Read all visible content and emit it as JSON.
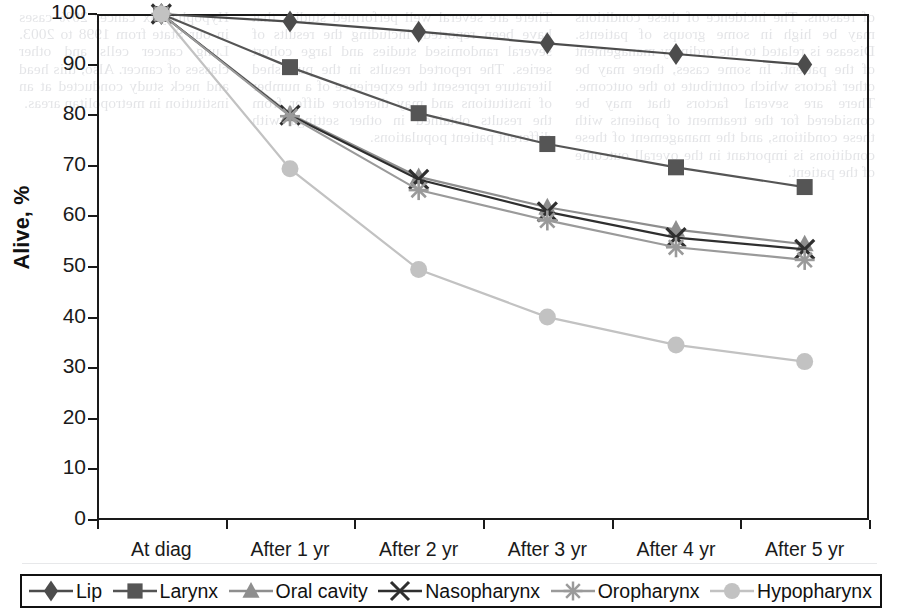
{
  "chart_data": {
    "type": "line",
    "title": "",
    "xlabel": "",
    "ylabel": "Alive, %",
    "ylim": [
      0,
      100
    ],
    "ytick_step": 10,
    "yticks": [
      "100",
      "90",
      "80",
      "70",
      "60",
      "50",
      "40",
      "30",
      "20",
      "10",
      "0"
    ],
    "grid": false,
    "legend_position": "bottom",
    "categories": [
      "At diag",
      "After 1 yr",
      "After 2 yr",
      "After 3 yr",
      "After 4 yr",
      "After 5 yr"
    ],
    "series": [
      {
        "name": "Lip",
        "marker": "diamond",
        "color": "#4c4c4c",
        "values": [
          100,
          98.5,
          96.5,
          94.2,
          92.1,
          90.0
        ]
      },
      {
        "name": "Larynx",
        "marker": "square",
        "color": "#555555",
        "values": [
          100,
          89.5,
          80.4,
          74.3,
          69.7,
          65.8
        ]
      },
      {
        "name": "Oral cavity",
        "marker": "triangle",
        "color": "#8e8e8e",
        "values": [
          100,
          80.2,
          67.8,
          61.8,
          57.4,
          54.5
        ]
      },
      {
        "name": "Nasopharynx",
        "marker": "cross-x",
        "color": "#2f2f2f",
        "values": [
          100,
          80.0,
          67.3,
          60.9,
          55.8,
          53.5
        ]
      },
      {
        "name": "Oropharynx",
        "marker": "asterisk",
        "color": "#9a9a9a",
        "values": [
          100,
          79.8,
          65.2,
          59.2,
          53.9,
          51.4
        ]
      },
      {
        "name": "Hypopharynx",
        "marker": "circle",
        "color": "#c2c2c2",
        "values": [
          100,
          69.4,
          49.5,
          40.1,
          34.6,
          31.3
        ]
      }
    ]
  },
  "axis": {
    "y_title": "Alive, %"
  },
  "bleed_text": {
    "col_a": "of reasons. The incidence of these conditions may be high in some groups of patients. Disease is related to the ordinary management of the patient. In some cases, there may be other factors which contribute to the outcome. There are several factors that may be considered for the treatment of patients with these conditions, and the management of these conditions is important in the overall outcome of the patient.",
    "col_b": "There are several well performed studies that have been reported, including the results of several randomised studies and large cohort series. The reported results in the published literature represent the experience of a number of institutions and may therefore differ from the results obtained in other settings with different patient populations.",
    "col_c": "Hypopharynx cancer 20% cases in our State from 1998 to 2003. Lung cancer cells and other classes of cancer. Also, this head and neck study conducted at an institution in metropolitan areas."
  },
  "legend": {
    "items": [
      {
        "label": "Lip",
        "marker": "diamond"
      },
      {
        "label": "Larynx",
        "marker": "square"
      },
      {
        "label": "Oral cavity",
        "marker": "triangle"
      },
      {
        "label": "Nasopharynx",
        "marker": "cross-x"
      },
      {
        "label": "Oropharynx",
        "marker": "asterisk"
      },
      {
        "label": "Hypopharynx",
        "marker": "circle"
      }
    ]
  }
}
